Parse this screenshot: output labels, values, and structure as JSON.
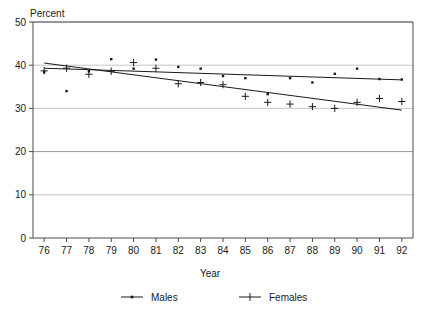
{
  "chart_data": {
    "type": "scatter",
    "title": "Percent",
    "xlabel": "Year",
    "ylabel": "",
    "grid": true,
    "legend_position": "bottom",
    "xlim": [
      75.5,
      92.5
    ],
    "ylim": [
      0,
      50
    ],
    "ytick_labels": [
      "0",
      "10",
      "20",
      "30",
      "40",
      "50"
    ],
    "yticks": [
      0,
      10,
      20,
      30,
      40,
      50
    ],
    "xtick_labels": [
      "76",
      "77",
      "78",
      "79",
      "80",
      "81",
      "82",
      "83",
      "84",
      "85",
      "86",
      "87",
      "88",
      "89",
      "90",
      "91",
      "92"
    ],
    "categories": [
      76,
      77,
      78,
      79,
      80,
      81,
      82,
      83,
      84,
      85,
      86,
      87,
      88,
      89,
      90,
      91,
      92
    ],
    "series": [
      {
        "name": "Males",
        "marker": "dot",
        "color": "#1a1a1a",
        "values": [
          38.4,
          34.0,
          38.6,
          41.4,
          39.2,
          41.3,
          39.6,
          39.2,
          37.5,
          37.0,
          33.3,
          37.0,
          36.0,
          38.0,
          39.2,
          36.8,
          36.7
        ],
        "trendline": {
          "start_year": 76,
          "start_value": 39.3,
          "end_year": 92,
          "end_value": 36.6
        }
      },
      {
        "name": "Females",
        "marker": "plus",
        "color": "#1a1a1a",
        "values": [
          38.7,
          39.3,
          37.9,
          38.6,
          40.6,
          39.3,
          35.7,
          36.0,
          35.5,
          32.8,
          31.4,
          31.0,
          30.4,
          30.0,
          31.4,
          32.3,
          31.6
        ],
        "trendline": {
          "start_year": 76,
          "start_value": 40.5,
          "end_year": 92,
          "end_value": 29.6
        }
      }
    ]
  },
  "legend": {
    "items": [
      {
        "label": "Males",
        "marker": "dot"
      },
      {
        "label": "Females",
        "marker": "plus"
      }
    ]
  },
  "colors": {
    "ink": "#1a1a1a",
    "grid": "#b8b8b8",
    "frame": "#4a4a4a",
    "background": "#ffffff"
  }
}
